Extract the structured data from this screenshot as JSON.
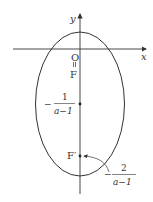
{
  "diagram": {
    "type": "ellipse-on-axes",
    "axes": {
      "x_label": "x",
      "y_label": "y",
      "origin_label": "O"
    },
    "points": {
      "focus_top": {
        "label": "F",
        "note": "O = F (coincident with origin)"
      },
      "focus_bottom": {
        "label": "F′"
      },
      "center": {
        "label_sign": "−",
        "numerator": "1",
        "denominator": "a−1"
      }
    },
    "annotation": {
      "sign": "−",
      "numerator": "2",
      "denominator": "a−1",
      "target": "F′"
    },
    "equals_mark": "="
  }
}
